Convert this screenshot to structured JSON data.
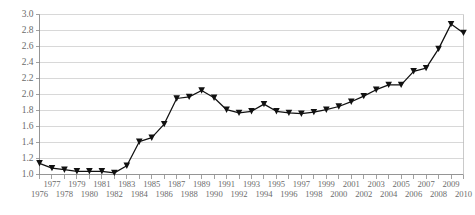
{
  "chart_data": {
    "type": "line",
    "title": "",
    "subtitle": "",
    "xlabel": "",
    "ylabel": "",
    "grid": true,
    "legend": false,
    "legend_position": "none",
    "marker": "triangle-down",
    "line_color": "#111111",
    "marker_color": "#111111",
    "gridline_color": "#c8c8c8",
    "axis_color": "#8a8a8a",
    "background_color": "#ffffff",
    "xlim": [
      1976,
      2010
    ],
    "ylim": [
      1.0,
      3.0
    ],
    "ytick_step": 0.2,
    "ytick_labels": [
      "1.0",
      "1.2",
      "1.4",
      "1.6",
      "1.8",
      "2.0",
      "2.2",
      "2.4",
      "2.6",
      "2.8",
      "3.0"
    ],
    "ytick_values": [
      1.0,
      1.2,
      1.4,
      1.6,
      1.8,
      2.0,
      2.2,
      2.4,
      2.6,
      2.8,
      3.0
    ],
    "xtick_labels_top": [
      "1977",
      "1979",
      "1981",
      "1983",
      "1985",
      "1987",
      "1989",
      "1991",
      "1993",
      "1995",
      "1997",
      "1999",
      "2001",
      "2003",
      "2005",
      "2007",
      "2009"
    ],
    "xtick_labels_bottom": [
      "1976",
      "1978",
      "1980",
      "1982",
      "1984",
      "1986",
      "1988",
      "1990",
      "1992",
      "1994",
      "1996",
      "1998",
      "2000",
      "2002",
      "2004",
      "2006",
      "2008",
      "2010"
    ],
    "categories": [
      1976,
      1977,
      1978,
      1979,
      1980,
      1981,
      1982,
      1983,
      1984,
      1985,
      1986,
      1987,
      1988,
      1989,
      1990,
      1991,
      1992,
      1993,
      1994,
      1995,
      1996,
      1997,
      1998,
      1999,
      2000,
      2001,
      2002,
      2003,
      2004,
      2005,
      2006,
      2007,
      2008,
      2009,
      2010
    ],
    "values": [
      1.14,
      1.08,
      1.06,
      1.04,
      1.04,
      1.04,
      1.02,
      1.11,
      1.41,
      1.46,
      1.63,
      1.95,
      1.97,
      2.05,
      1.96,
      1.81,
      1.77,
      1.79,
      1.88,
      1.79,
      1.77,
      1.76,
      1.78,
      1.81,
      1.85,
      1.91,
      1.98,
      2.06,
      2.12,
      2.12,
      2.29,
      2.33,
      2.57,
      2.88,
      2.77
    ]
  }
}
